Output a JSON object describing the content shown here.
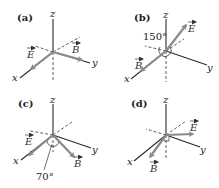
{
  "figure": {
    "panels": [
      {
        "id": "a",
        "label": "(a)",
        "axes": {
          "x": "x",
          "y": "y",
          "z": "z"
        },
        "vectors": {
          "E": "E",
          "B": "B"
        },
        "angle": null
      },
      {
        "id": "b",
        "label": "(b)",
        "axes": {
          "x": "x",
          "y": "y",
          "z": "z"
        },
        "vectors": {
          "E": "E",
          "B": "B"
        },
        "angle": "150°"
      },
      {
        "id": "c",
        "label": "(c)",
        "axes": {
          "x": "x",
          "y": "y",
          "z": "z"
        },
        "vectors": {
          "E": "E",
          "B": "B"
        },
        "angle": "70°"
      },
      {
        "id": "d",
        "label": "(d)",
        "axes": {
          "x": "x",
          "y": "y",
          "z": "z"
        },
        "vectors": {
          "E": "E",
          "B": "B"
        },
        "angle": null
      }
    ],
    "colors": {
      "axis": "#2a2a2a",
      "vector": "#8a8a8a",
      "background": "#ffffff"
    }
  }
}
